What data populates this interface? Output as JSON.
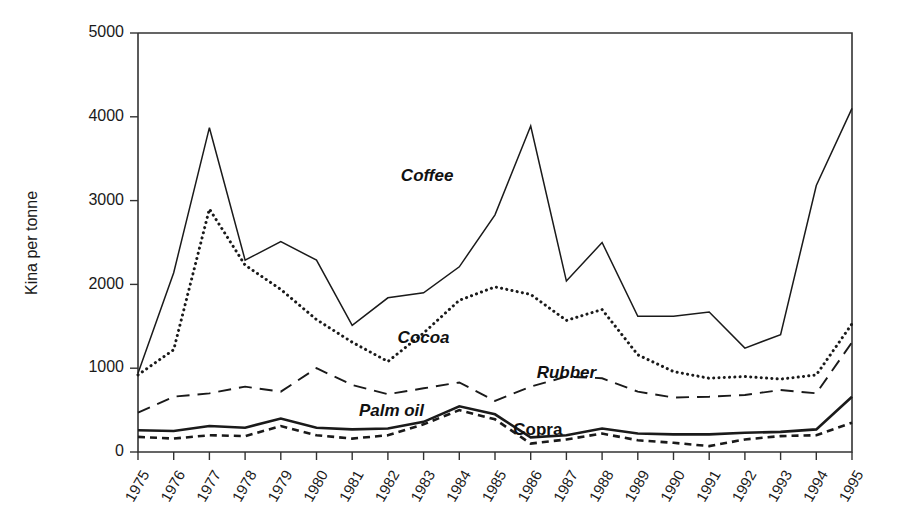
{
  "chart_data": {
    "type": "line",
    "title": "",
    "xlabel": "",
    "ylabel": "Kina per tonne",
    "ylim": [
      0,
      5000
    ],
    "yticks": [
      0,
      1000,
      2000,
      3000,
      4000,
      5000
    ],
    "ytick_labels": [
      "0",
      "1000",
      "2000",
      "3000",
      "4000",
      "5000"
    ],
    "grid": false,
    "legend_position": "inline-annotations",
    "categories": [
      "1975",
      "1976",
      "1977",
      "1978",
      "1979",
      "1980",
      "1981",
      "1982",
      "1983",
      "1984",
      "1985",
      "1986",
      "1987",
      "1988",
      "1989",
      "1990",
      "1991",
      "1992",
      "1993",
      "1994",
      "1995"
    ],
    "x": [
      1975,
      1976,
      1977,
      1978,
      1979,
      1980,
      1981,
      1982,
      1983,
      1984,
      1985,
      1986,
      1987,
      1988,
      1989,
      1990,
      1991,
      1992,
      1993,
      1994,
      1995
    ],
    "series": [
      {
        "name": "Coffee",
        "style": "solid-thin",
        "label_x": 1983.1,
        "label_y": 3230,
        "values": [
          940,
          2140,
          3870,
          2290,
          2510,
          2290,
          1510,
          1840,
          1900,
          2210,
          2830,
          3890,
          2040,
          2500,
          1620,
          1620,
          1670,
          1240,
          1400,
          3180,
          4100
        ]
      },
      {
        "name": "Cocoa",
        "style": "dotted",
        "label_x": 1983.0,
        "label_y": 1305,
        "values": [
          920,
          1220,
          2900,
          2230,
          1940,
          1580,
          1310,
          1080,
          1420,
          1810,
          1970,
          1880,
          1570,
          1700,
          1160,
          960,
          880,
          900,
          870,
          920,
          1530
        ]
      },
      {
        "name": "Rubber",
        "style": "dashed-long",
        "label_x": 1987.0,
        "label_y": 880,
        "values": [
          470,
          660,
          700,
          780,
          720,
          1000,
          800,
          690,
          760,
          830,
          610,
          780,
          900,
          880,
          720,
          650,
          660,
          680,
          740,
          700,
          1310
        ]
      },
      {
        "name": "Palm oil",
        "style": "solid-thick",
        "label_x": 1982.1,
        "label_y": 430,
        "values": [
          260,
          250,
          310,
          290,
          400,
          290,
          270,
          280,
          360,
          545,
          450,
          175,
          200,
          280,
          220,
          210,
          210,
          230,
          240,
          270,
          660
        ]
      },
      {
        "name": "Copra",
        "style": "dashed-short",
        "label_x": 1986.2,
        "label_y": 205,
        "values": [
          180,
          160,
          200,
          190,
          310,
          200,
          160,
          200,
          330,
          500,
          390,
          100,
          150,
          220,
          140,
          110,
          70,
          150,
          190,
          200,
          350
        ]
      }
    ]
  }
}
